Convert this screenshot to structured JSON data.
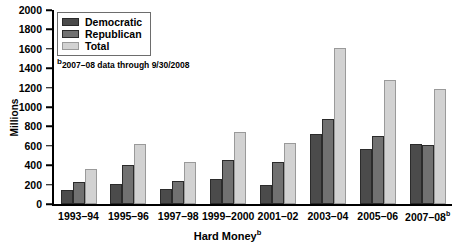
{
  "chart_data": {
    "type": "bar",
    "title": "",
    "xlabel": "Hard Money",
    "xlabel_superscript": "b",
    "ylabel": "Millions",
    "ylim": [
      0,
      2000
    ],
    "ytick_step": 200,
    "yticks": [
      "2000",
      "1800",
      "1600",
      "1400",
      "1200",
      "1000",
      "800",
      "600",
      "400",
      "200",
      "0"
    ],
    "grid": false,
    "legend_position": "top-left",
    "categories": [
      "1993–94",
      "1995–96",
      "1997–98",
      "1999–2000",
      "2001–02",
      "2003–04",
      "2005–06",
      "2007–08"
    ],
    "category_superscripts": [
      "",
      "",
      "",
      "",
      "",
      "",
      "",
      "b"
    ],
    "series": [
      {
        "name": "Democratic",
        "color": "#4b4b4b",
        "values": [
          145,
          210,
          155,
          260,
          200,
          720,
          565,
          615
        ]
      },
      {
        "name": "Republican",
        "color": "#717171",
        "values": [
          230,
          405,
          240,
          450,
          430,
          875,
          700,
          605
        ]
      },
      {
        "name": "Total",
        "color": "#d2d2d2",
        "values": [
          365,
          615,
          430,
          740,
          625,
          1605,
          1280,
          1185
        ]
      }
    ],
    "annotations": [
      {
        "marker": "b",
        "text": "2007–08 data through 9/30/2008"
      }
    ]
  }
}
